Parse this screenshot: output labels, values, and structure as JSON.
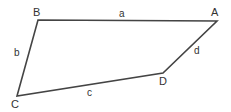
{
  "figure": {
    "type": "quadrilateral-diagram",
    "background_color": "#ffffff",
    "stroke_color": "#444444",
    "text_color": "#333333",
    "stroke_width": 1.6,
    "canvas": {
      "width": 231,
      "height": 112
    },
    "vertices": [
      {
        "name": "B",
        "label": "B",
        "x": 38,
        "y": 20
      },
      {
        "name": "A",
        "label": "A",
        "x": 217,
        "y": 21
      },
      {
        "name": "D",
        "label": "D",
        "x": 163,
        "y": 73
      },
      {
        "name": "C",
        "label": "C",
        "x": 17,
        "y": 96
      }
    ],
    "sides": [
      {
        "name": "a",
        "label": "a",
        "from": "B",
        "to": "A"
      },
      {
        "name": "d",
        "label": "d",
        "from": "A",
        "to": "D"
      },
      {
        "name": "c",
        "label": "c",
        "from": "D",
        "to": "C"
      },
      {
        "name": "b",
        "label": "b",
        "from": "C",
        "to": "B"
      }
    ],
    "vertex_labels": {
      "A": "A",
      "B": "B",
      "C": "C",
      "D": "D"
    },
    "side_labels": {
      "a": "a",
      "b": "b",
      "c": "c",
      "d": "d"
    },
    "path": "M 38 20 L 217 21 L 163 73 L 17 96 Z"
  }
}
